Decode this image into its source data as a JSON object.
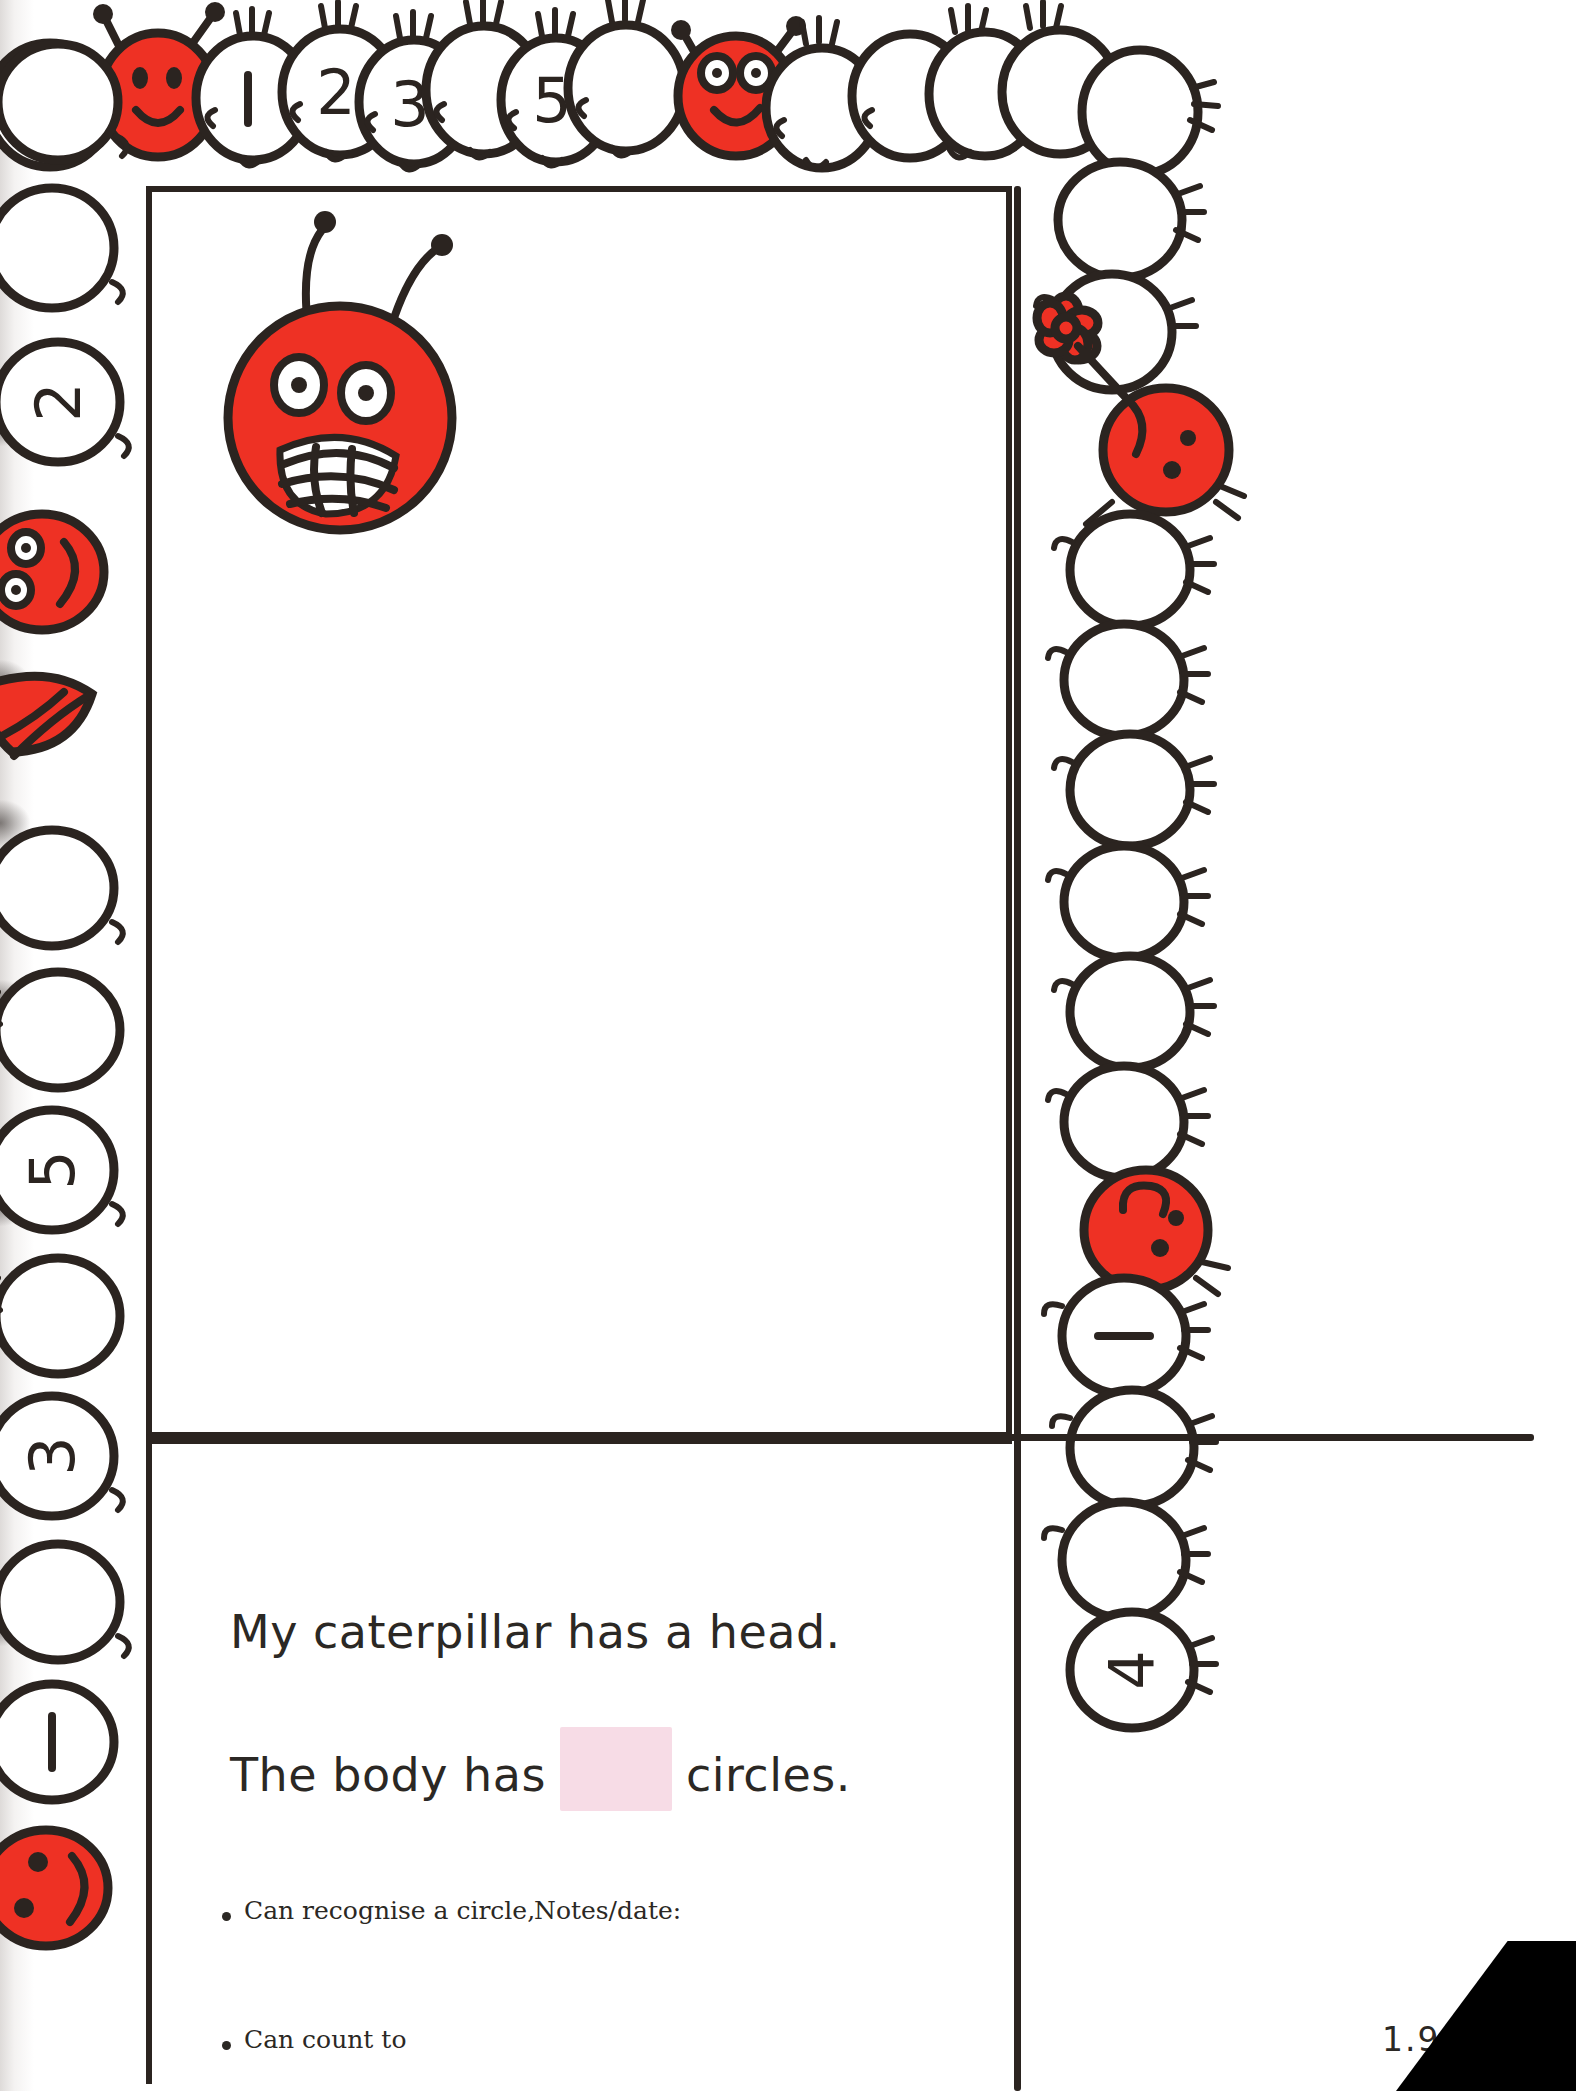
{
  "page": {
    "version_label": "1.9",
    "page_number": "13",
    "accent_red": "#ee3124",
    "ink_color": "#2b2420",
    "blank_box_color": "#f7dce6"
  },
  "worksheet": {
    "sentence1": "My caterpillar has a head.",
    "sentence2_before": "The body has",
    "sentence2_after": "circles.",
    "blank_name": "answer-blank-box"
  },
  "footer": {
    "bullets": [
      "Can recognise a circle,",
      "Can count to"
    ],
    "notes_label": "Notes/date:"
  },
  "border_caterpillars": {
    "top": {
      "name": "top-caterpillar",
      "head_style": "smiley-red-head",
      "segments": [
        "1",
        "2",
        "3",
        "",
        "5",
        ""
      ],
      "second_head_style": "big-eyes-red-head",
      "trailing_blank_segments": 4
    },
    "left": {
      "name": "left-caterpillar",
      "segments": [
        "",
        "",
        "2",
        ""
      ],
      "head_style": "rotated-red-face",
      "mouth_shape": "open-red-mouth",
      "lower_segments": [
        "",
        "",
        "5",
        "",
        "3",
        "",
        "1"
      ],
      "bottom_head_style": "smiley-red-head"
    },
    "right": {
      "name": "right-caterpillar",
      "top_blank_segments": 3,
      "flower_head_style": "red-head-with-flower",
      "middle_blank_segments": 6,
      "second_head_style": "red-head-curl",
      "lower_segments": [
        "1",
        "",
        "",
        "4"
      ]
    }
  },
  "illustration": {
    "name": "big-red-caterpillar-head",
    "description": "large red circular head with two antennae, two eyes and a grinning toothy mouth"
  },
  "icons": {
    "bullet": "bullet-dot-icon",
    "flower": "flower-icon",
    "antenna": "antenna-icon"
  }
}
